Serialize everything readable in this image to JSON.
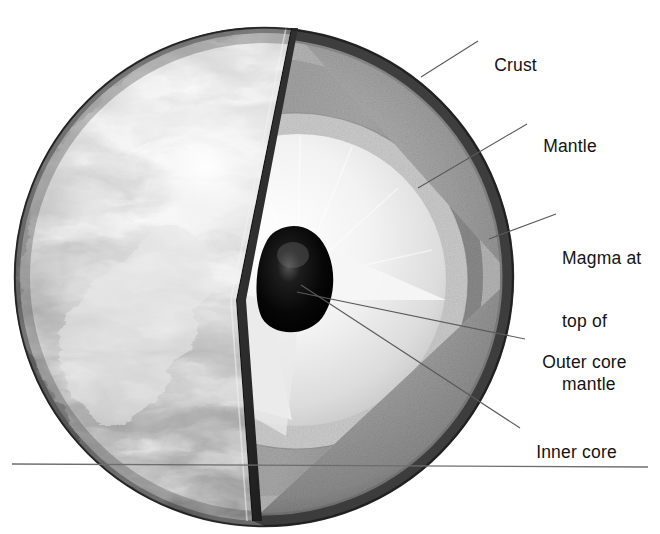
{
  "figure": {
    "kind": "cutaway-cross-section",
    "background_color": "#ffffff",
    "text_color": "#131313",
    "leader_line_color": "#5a5a5a",
    "horizon_line_color": "#6e6e6e"
  },
  "labels": [
    {
      "id": "crust",
      "text": "Crust",
      "x": 484,
      "y": 34,
      "lines": [
        "Crust"
      ]
    },
    {
      "id": "mantle",
      "text": "Mantle",
      "x": 533,
      "y": 115,
      "lines": [
        "Mantle"
      ]
    },
    {
      "id": "magma",
      "text": "Magma at top of mantle",
      "x": 562,
      "y": 206,
      "lines": [
        "Magma at",
        "top of",
        "mantle"
      ]
    },
    {
      "id": "outer-core",
      "text": "Outer core",
      "x": 532,
      "y": 331,
      "lines": [
        "Outer core"
      ]
    },
    {
      "id": "inner-core",
      "text": "Inner core",
      "x": 526,
      "y": 421,
      "lines": [
        "Inner core"
      ]
    }
  ],
  "leader_lines": [
    {
      "id": "crust-leader",
      "x1": 421,
      "y1": 77,
      "x2": 478,
      "y2": 41
    },
    {
      "id": "mantle-leader",
      "x1": 418,
      "y1": 188,
      "x2": 527,
      "y2": 124
    },
    {
      "id": "magma-leader",
      "x1": 489,
      "y1": 239,
      "x2": 556,
      "y2": 214
    },
    {
      "id": "outer-core-leader",
      "x1": 297,
      "y1": 292,
      "x2": 525,
      "y2": 339
    },
    {
      "id": "inner-core-leader",
      "x1": 301,
      "y1": 285,
      "x2": 520,
      "y2": 428
    }
  ],
  "horizon_line": {
    "x1": 12,
    "y1": 464,
    "x2": 648,
    "y2": 467
  },
  "globe": {
    "center_x": 264,
    "center_y": 277,
    "radius": 249,
    "cut_apex_top_x": 291,
    "cut_apex_top_y": 28,
    "cut_apex_bottom_x": 252,
    "cut_apex_bottom_y": 521
  },
  "layers": [
    {
      "id": "crust",
      "name": "Crust",
      "fill": "#3d3d3d",
      "note": "thin dark outer rind"
    },
    {
      "id": "mantle",
      "name": "Mantle",
      "fill": "#8c8c8c",
      "note": "broad speckled grey shell"
    },
    {
      "id": "magma",
      "name": "Magma at top of mantle",
      "fill": "#b6b6b6",
      "note": "lighter zone under crust"
    },
    {
      "id": "outer-core",
      "name": "Outer core",
      "fill": "#eaeaea",
      "note": "pale bright sphere"
    },
    {
      "id": "inner-core",
      "name": "Inner core",
      "fill": "#0a0a0a",
      "note": "small black sphere at centre"
    },
    {
      "id": "surface",
      "name": "Earth surface",
      "fill": "#9a9a9a",
      "note": "cloudy greyscale globe face"
    }
  ]
}
